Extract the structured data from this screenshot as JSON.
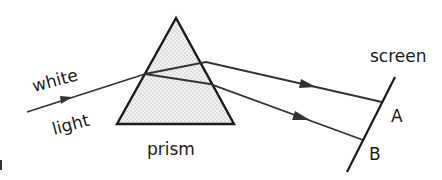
{
  "diagram": {
    "labels": {
      "white": "white",
      "light": "light",
      "prism": "prism",
      "screen": "screen",
      "point_a": "A",
      "point_b": "B"
    },
    "colors": {
      "stroke": "#1a1a1a",
      "ray": "#333333",
      "prism_fill": "#e6e6e6",
      "prism_dots": "#9a9a9a",
      "background": "#ffffff"
    },
    "geometry": {
      "prism": {
        "apex": [
          176,
          18
        ],
        "base_left": [
          117,
          124
        ],
        "base_right": [
          234,
          124
        ]
      },
      "incident_ray": {
        "from": [
          27,
          112
        ],
        "to": [
          145,
          74
        ]
      },
      "upper_ray": {
        "points": [
          [
            145,
            74
          ],
          [
            206,
            62
          ],
          [
            382,
            102
          ]
        ]
      },
      "lower_ray": {
        "points": [
          [
            145,
            74
          ],
          [
            210,
            84
          ],
          [
            363,
            140
          ]
        ]
      },
      "screen": {
        "from": [
          395,
          77
        ],
        "to": [
          347,
          172
        ]
      }
    }
  }
}
